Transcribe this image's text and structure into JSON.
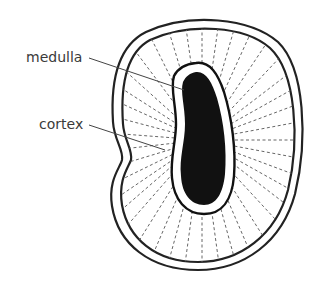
{
  "diagram": {
    "labels": [
      {
        "id": "medulla",
        "text": "medulla"
      },
      {
        "id": "cortex",
        "text": "cortex"
      }
    ],
    "colors": {
      "outline": "#222222",
      "medulla_fill": "#111111",
      "ray": "#666666",
      "leader": "#444444",
      "text": "#3a3a3a",
      "background": "#ffffff"
    }
  }
}
